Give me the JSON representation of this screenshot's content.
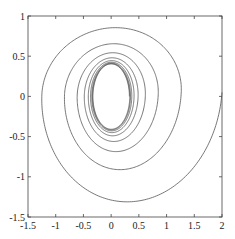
{
  "chart_data": {
    "type": "line",
    "title": "",
    "xlabel": "",
    "ylabel": "",
    "xlim": [
      -1.5,
      2
    ],
    "ylim": [
      -1.5,
      1
    ],
    "grid": false,
    "legend": null,
    "x_ticks": [
      "-1.5",
      "-1",
      "-0.5",
      "0",
      "0.5",
      "1",
      "1.5",
      "2"
    ],
    "y_ticks": [
      "-1.5",
      "-1",
      "-0.5",
      "0",
      "0.5",
      "1"
    ],
    "series": [
      {
        "name": "trajectory",
        "color": "#555555",
        "start": [
          2.0,
          0.05
        ],
        "end_cycle_center": [
          0.0,
          0.0
        ],
        "loops": [
          {
            "rx": 1.6,
            "ry_top": 0.95,
            "ry_bottom": 1.45,
            "cx": 0.2
          },
          {
            "rx": 0.75,
            "ry": 0.68,
            "cx": 0.05
          },
          {
            "rx": 0.55,
            "ry": 0.55,
            "cx": 0.02
          },
          {
            "rx": 0.47,
            "ry": 0.5,
            "cx": 0.01
          },
          {
            "rx": 0.42,
            "ry": 0.47,
            "cx": 0.0
          },
          {
            "rx": 0.39,
            "ry": 0.45,
            "cx": 0.0
          },
          {
            "rx": 0.37,
            "ry": 0.43,
            "cx": 0.0
          },
          {
            "rx": 0.35,
            "ry": 0.42,
            "cx": 0.0
          },
          {
            "rx": 0.33,
            "ry": 0.41,
            "cx": 0.0
          }
        ]
      }
    ]
  }
}
